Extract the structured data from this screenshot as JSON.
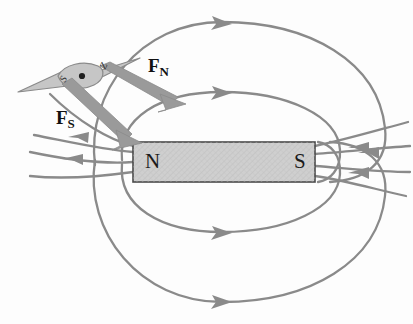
{
  "diagram": {
    "background_color": "#fdfdfd",
    "field_line_color": "#8a8a8a",
    "magnet_fill_color": "#cfcfcf",
    "magnet_border_color": "#4a4a4a",
    "arrow_color": "#9a9a9a",
    "needle_fill_color": "#c6c6c6",
    "needle_border_color": "#8a8a8a"
  },
  "magnet": {
    "north_label": "N",
    "south_label": "S",
    "x": 133,
    "y": 142,
    "width": 182,
    "height": 40
  },
  "compass": {
    "south_tip_label": "S",
    "north_tip_label": "Z",
    "pivot_dot": "center-pivot-dot"
  },
  "forces": [
    {
      "id": "force-north",
      "symbol": "F",
      "subscript": "N",
      "label_x": 148,
      "label_y": 56,
      "from": [
        104,
        72
      ],
      "to": [
        172,
        102
      ]
    },
    {
      "id": "force-south",
      "symbol": "F",
      "subscript": "S",
      "label_x": 56,
      "label_y": 108,
      "from": [
        68,
        90
      ],
      "to": [
        132,
        140
      ]
    }
  ],
  "field_lines": {
    "description": "Closed magnetic flux loops exiting the S pole region and re-entering at the N pole",
    "top_loops": 2,
    "bottom_loops": 2,
    "left_fan_lines": 4,
    "right_fan_lines": 4,
    "top_arrow_direction": "right",
    "bottom_arrow_direction": "right",
    "left_arrow_direction": "left",
    "right_arrow_direction": "left"
  }
}
